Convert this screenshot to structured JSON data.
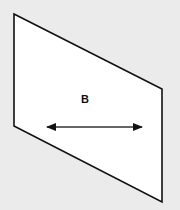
{
  "diagram": {
    "background": "#ebebeb",
    "panel": {
      "fill": "#ffffff",
      "stroke": "#111111",
      "points": [
        [
          14,
          14
        ],
        [
          162,
          89
        ],
        [
          162,
          202
        ],
        [
          14,
          126
        ]
      ]
    },
    "label": {
      "text": "B",
      "x": 81,
      "y": 103
    },
    "arrow": {
      "x1": 47,
      "y1": 127,
      "x2": 142,
      "y2": 127,
      "color": "#222222",
      "heads": "both"
    }
  }
}
